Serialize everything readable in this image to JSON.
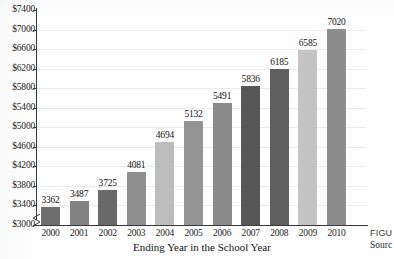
{
  "chart_data": {
    "type": "bar",
    "title": "",
    "xlabel": "Ending Year in the School Year",
    "ylabel": "",
    "categories": [
      "2000",
      "2001",
      "2002",
      "2003",
      "2004",
      "2005",
      "2006",
      "2007",
      "2008",
      "2009",
      "2010"
    ],
    "values": [
      3362,
      3487,
      3725,
      4081,
      4694,
      5132,
      5491,
      5836,
      6185,
      6585,
      7020
    ],
    "data_labels": [
      "3362",
      "3487",
      "3725",
      "4081",
      "4694",
      "5132",
      "5491",
      "5836",
      "6185",
      "6585",
      "7020"
    ],
    "ylim": [
      3000,
      7400
    ],
    "ytick_step": 400,
    "ytick_labels": [
      "$7400",
      "$7000",
      "$6600",
      "$6200",
      "$5800",
      "$5400",
      "$5000",
      "$4600",
      "$4200",
      "$3800",
      "$3400",
      "$3000"
    ],
    "ytick_values": [
      7400,
      7000,
      6600,
      6200,
      5800,
      5400,
      5000,
      4600,
      4200,
      3800,
      3400,
      3000
    ],
    "grid": true,
    "legend": "none",
    "axis_break": true,
    "bar_colors": [
      "#6e6e6e",
      "#828282",
      "#6a6a6a",
      "#8f8f8f",
      "#bcbcbc",
      "#949494",
      "#8a8a8a",
      "#575757",
      "#5f5f5f",
      "#c4c4c4",
      "#8d8d8d"
    ]
  },
  "caption": {
    "figure_tag": "FIGU",
    "source_tag": "Sourc"
  }
}
